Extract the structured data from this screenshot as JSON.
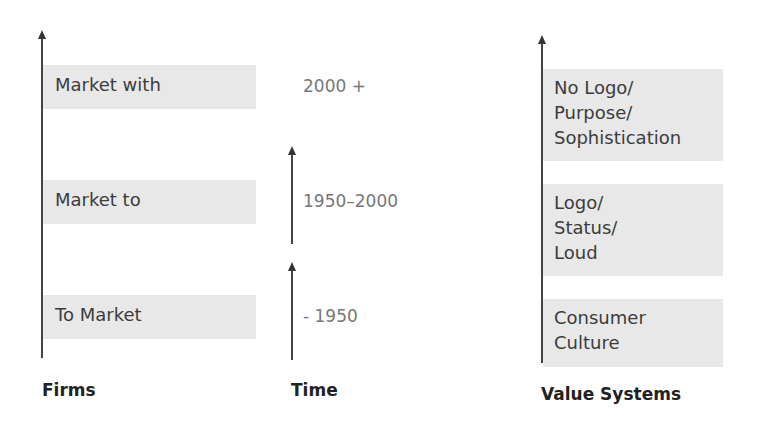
{
  "columns": {
    "firms": {
      "title": "Firms",
      "items": [
        "Market with",
        "Market to",
        "To Market"
      ]
    },
    "time": {
      "title": "Time",
      "items": [
        "2000 +",
        "1950–2000",
        "- 1950"
      ]
    },
    "value_systems": {
      "title": "Value Systems",
      "items": [
        [
          "No Logo/",
          "Purpose/",
          "Sophistication"
        ],
        [
          "Logo/",
          "Status/",
          "Loud"
        ],
        [
          "Consumer",
          "Culture"
        ]
      ]
    }
  },
  "colors": {
    "box_fill": "#e8e8e8",
    "arrow": "#444444",
    "time_text": "#777777",
    "title_text": "#222222"
  }
}
